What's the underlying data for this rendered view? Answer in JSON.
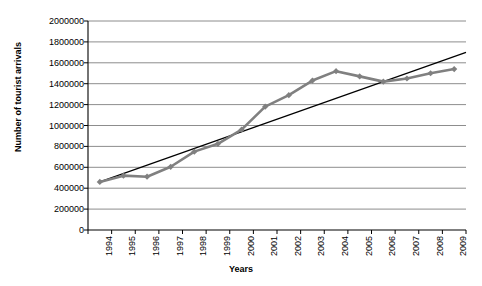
{
  "chart_data": {
    "type": "line",
    "title": "",
    "xlabel": "Years",
    "ylabel": "Number of tourist arrivals",
    "categories": [
      "1994",
      "1995",
      "1996",
      "1997",
      "1998",
      "1999",
      "2000",
      "2001",
      "2002",
      "2003",
      "2004",
      "2005",
      "2006",
      "2007",
      "2008",
      "2009"
    ],
    "ylim": [
      0,
      2000000
    ],
    "ytick_labels": [
      "0",
      "200000",
      "400000",
      "600000",
      "800000",
      "1000000",
      "1200000",
      "1400000",
      "1600000",
      "1800000",
      "2000000"
    ],
    "ytick_values": [
      0,
      200000,
      400000,
      600000,
      800000,
      1000000,
      1200000,
      1400000,
      1600000,
      1800000,
      2000000
    ],
    "grid": true,
    "legend": "none",
    "series": [
      {
        "name": "Number of tourist arrivals",
        "type": "line",
        "marker": "diamond",
        "color": "#808080",
        "values": [
          460000,
          520000,
          510000,
          605000,
          750000,
          825000,
          960000,
          1180000,
          1290000,
          1430000,
          1520000,
          1470000,
          1420000,
          1450000,
          1500000,
          1540000
        ]
      },
      {
        "name": "Linear trend",
        "type": "trendline",
        "marker": "none",
        "color": "#000000",
        "values": [
          460000,
          542700,
          625300,
          708000,
          790700,
          873300,
          956000,
          1038700,
          1121300,
          1204000,
          1286700,
          1369300,
          1452000,
          1534700,
          1617300,
          1700000
        ]
      }
    ]
  },
  "colors": {
    "series_gray": "#808080",
    "trend_black": "#000000",
    "gridline": "#808080",
    "axis": "#000000",
    "background": "#ffffff"
  }
}
